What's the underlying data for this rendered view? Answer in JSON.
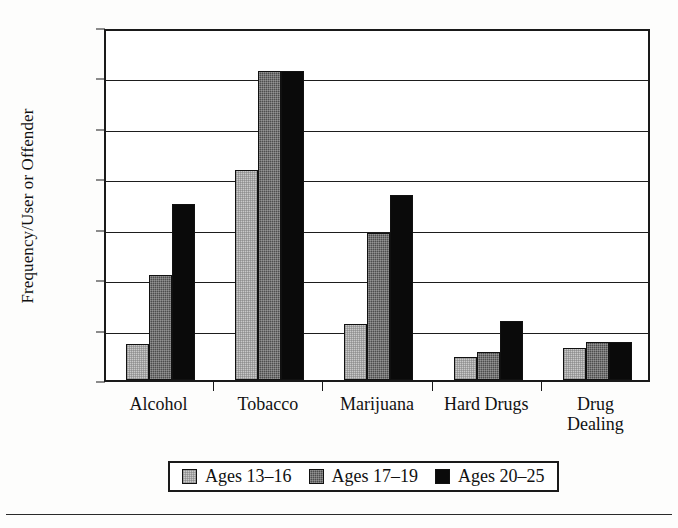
{
  "chart_data": {
    "type": "bar",
    "title": "",
    "xlabel": "",
    "ylabel": "Frequency/User or Offender",
    "categories": [
      "Alcohol",
      "Tobacco",
      "Marijuana",
      "Hard Drugs",
      "Drug Dealing"
    ],
    "series": [
      {
        "name": "Ages 13–16",
        "color": "#c9c9c9",
        "values": [
          36,
          208,
          56,
          23,
          32
        ]
      },
      {
        "name": "Ages 17–19",
        "color": "#4d4d4d",
        "values": [
          104,
          306,
          146,
          28,
          38
        ]
      },
      {
        "name": "Ages 20–25",
        "color": "#0a0a0a",
        "values": [
          175,
          306,
          183,
          59,
          38
        ]
      }
    ],
    "ylim": [
      0,
      350
    ],
    "yticks": [
      0,
      50,
      100,
      150,
      200,
      250,
      300,
      350
    ],
    "ytick_labels": [
      "0",
      "50",
      "100",
      "150",
      "200",
      "250",
      "300",
      "350"
    ],
    "grid": true,
    "grid_axis": "y",
    "legend_position": "below-center",
    "plot_border": true
  },
  "legend": {
    "items": [
      {
        "label": "Ages 13–16",
        "swatch": "light-gray-hatch"
      },
      {
        "label": "Ages 17–19",
        "swatch": "dark-gray-hatch"
      },
      {
        "label": "Ages 20–25",
        "swatch": "solid-black"
      }
    ]
  }
}
